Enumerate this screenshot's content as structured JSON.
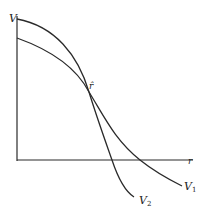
{
  "diagram": {
    "axes": {
      "y_label": "V",
      "x_label": "r"
    },
    "intersection_label": "r̂",
    "curves": [
      {
        "name": "V1",
        "label_main": "V",
        "label_sub": "1"
      },
      {
        "name": "V2",
        "label_main": "V",
        "label_sub": "2"
      }
    ],
    "line_color": "#2a2a2a"
  }
}
